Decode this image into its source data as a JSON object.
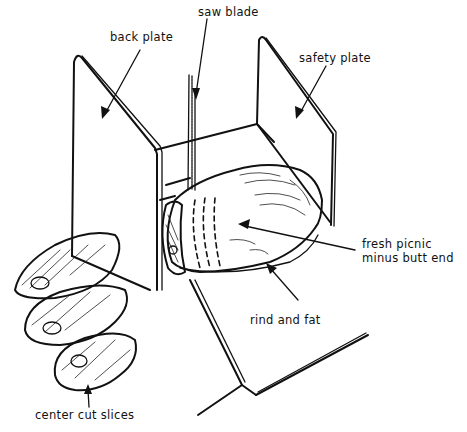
{
  "diagram": {
    "type": "line-illustration",
    "labels": {
      "saw_blade": "saw blade",
      "back_plate": "back plate",
      "safety_plate": "safety plate",
      "fresh_picnic_line1": "fresh picnic",
      "fresh_picnic_line2": "minus butt end",
      "rind_and_fat": "rind and fat",
      "center_cut_slices": "center cut slices"
    },
    "colors": {
      "ink": "#111111",
      "background": "#ffffff"
    }
  }
}
